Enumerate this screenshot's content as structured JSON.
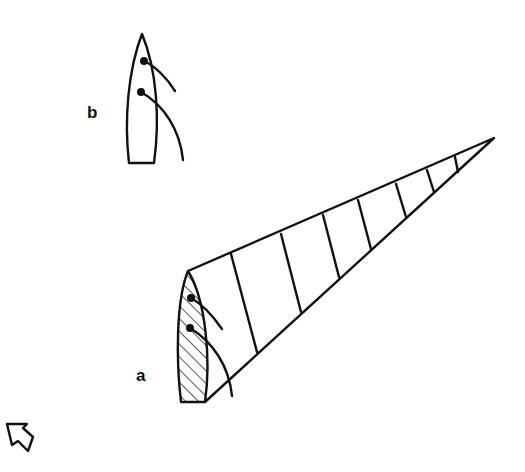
{
  "diagram": {
    "type": "sailing-diagram",
    "background": "#ffffff",
    "ink_color": "#111111",
    "labels": {
      "boat_a": "a",
      "boat_b": "b"
    },
    "elements": [
      {
        "id": "boat-b",
        "label": "b",
        "description": "Sailboat hull seen from above with two sails (telltale curves)"
      },
      {
        "id": "boat-a",
        "label": "a",
        "description": "Hatched sailboat hull with a long tapering wind shadow cone divided by cross lines"
      },
      {
        "id": "wind-shadow",
        "segments": 8,
        "description": "Tapering wedge extending from boat a to the upper right"
      },
      {
        "id": "wind-arrow",
        "description": "Outline arrow in lower-left corner indicating wind direction"
      }
    ]
  }
}
